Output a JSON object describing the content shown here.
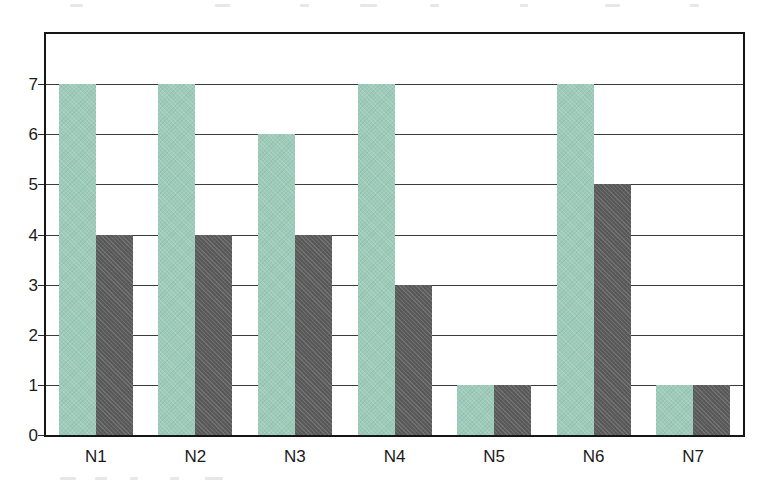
{
  "chart_data": {
    "type": "bar",
    "title": "",
    "subtitle": "",
    "xlabel": "",
    "ylabel": "",
    "categories": [
      "N1",
      "N2",
      "N3",
      "N4",
      "N5",
      "N6",
      "N7"
    ],
    "series": [
      {
        "name": "series-1",
        "color": "#9dcbba",
        "values": [
          7,
          7,
          6,
          7,
          1,
          7,
          1
        ]
      },
      {
        "name": "series-2",
        "color": "#5b5b5b",
        "values": [
          4,
          4,
          4,
          3,
          1,
          5,
          1
        ]
      }
    ],
    "ylim": [
      0,
      8
    ],
    "ytick_labels": [
      "0",
      "1",
      "2",
      "3",
      "4",
      "5",
      "6",
      "7"
    ],
    "ytick_values": [
      0,
      1,
      2,
      3,
      4,
      5,
      6,
      7
    ],
    "grid": "horizontal",
    "legend": "none",
    "annotations": [],
    "frame_color": "#161616",
    "gridline_color": "#3b3b3b",
    "background": "#ffffff"
  }
}
